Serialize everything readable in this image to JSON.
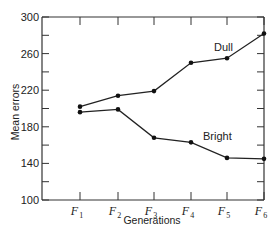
{
  "chart_data": {
    "type": "line",
    "title": "",
    "xlabel": "Generations",
    "ylabel": "Mean errors",
    "categories": [
      "F1",
      "F2",
      "F3",
      "F4",
      "F5",
      "F6"
    ],
    "category_display": [
      {
        "base": "F",
        "sub": "1"
      },
      {
        "base": "F",
        "sub": "2"
      },
      {
        "base": "F",
        "sub": "3"
      },
      {
        "base": "F",
        "sub": "4"
      },
      {
        "base": "F",
        "sub": "5"
      },
      {
        "base": "F",
        "sub": "6"
      }
    ],
    "series": [
      {
        "name": "Dull",
        "values": [
          202,
          214,
          219,
          250,
          255,
          282
        ]
      },
      {
        "name": "Bright",
        "values": [
          196,
          199,
          168,
          163,
          146,
          145
        ]
      }
    ],
    "ylim": [
      100,
      300
    ],
    "yticks_labeled": [
      100,
      140,
      180,
      220,
      260,
      300
    ],
    "yticks_minor_step": 20,
    "grid": false,
    "legend": "inline labels next to lines",
    "colors": {
      "line": "#222222",
      "axis": "#333333",
      "marker": "#111111"
    }
  }
}
